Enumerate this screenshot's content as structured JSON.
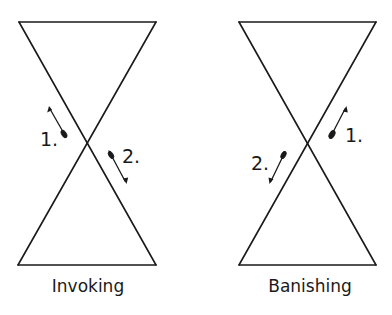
{
  "figures": [
    {
      "id": "invoking",
      "caption": "Invoking",
      "shape": {
        "top_left": [
          19,
          22
        ],
        "top_right": [
          156,
          22
        ],
        "bottom_left": [
          18,
          265
        ],
        "bottom_right": [
          156,
          265
        ],
        "crossing": [
          87,
          143
        ]
      },
      "strokes": [
        {
          "step": "1.",
          "direction": "up-left",
          "tail": [
            66,
            137
          ],
          "tip": [
            49,
            107
          ],
          "label_pos": [
            40,
            146
          ]
        },
        {
          "step": "2.",
          "direction": "down-right",
          "tail": [
            109,
            151
          ],
          "tip": [
            126,
            183
          ],
          "label_pos": [
            122,
            163
          ]
        }
      ]
    },
    {
      "id": "banishing",
      "caption": "Banishing",
      "shape": {
        "top_left": [
          239,
          22
        ],
        "top_right": [
          376,
          22
        ],
        "bottom_left": [
          239,
          265
        ],
        "bottom_right": [
          376,
          265
        ],
        "crossing": [
          307,
          143
        ]
      },
      "strokes": [
        {
          "step": "1.",
          "direction": "up-right",
          "tail": [
            330,
            138
          ],
          "tip": [
            346,
            107
          ],
          "label_pos": [
            345,
            142
          ]
        },
        {
          "step": "2.",
          "direction": "down-left",
          "tail": [
            285,
            152
          ],
          "tip": [
            270,
            183
          ],
          "label_pos": [
            251,
            170
          ]
        }
      ]
    }
  ],
  "colors": {
    "ink": "#1a1a1a",
    "background": "#ffffff"
  }
}
